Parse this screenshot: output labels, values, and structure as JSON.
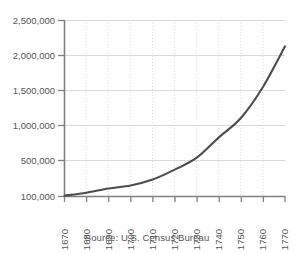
{
  "chart_data": {
    "type": "line",
    "title": "",
    "subtitle": "",
    "xlabel": "",
    "ylabel": "",
    "x": [
      1670,
      1680,
      1690,
      1700,
      1710,
      1720,
      1730,
      1740,
      1750,
      1760,
      1770
    ],
    "values": [
      111000,
      152000,
      210000,
      251000,
      332000,
      466000,
      629000,
      906000,
      1171000,
      1594000,
      2148000
    ],
    "series": [
      {
        "name": "U.S. population",
        "values": [
          111000,
          152000,
          210000,
          251000,
          332000,
          466000,
          629000,
          906000,
          1171000,
          1594000,
          2148000
        ]
      }
    ],
    "x_tick_labels": [
      "1670",
      "1680",
      "1690",
      "1700",
      "1710",
      "1720",
      "1730",
      "1740",
      "1750",
      "1760",
      "1770"
    ],
    "y_tick_labels": [
      "2,500,000",
      "2,000,000",
      "1,500,000",
      "1,000,000",
      "500,000",
      "100,000"
    ],
    "y_tick_values": [
      2500000,
      2000000,
      1500000,
      1000000,
      500000,
      100000
    ],
    "xlim": [
      1670,
      1770
    ],
    "ylim": [
      100000,
      2500000
    ],
    "grid": "horizontal-solid-vertical-dotted",
    "legend": "none",
    "line_color": "#4d4d4d",
    "grid_color": "#d9d9d9",
    "axis_color": "#808080",
    "text_color": "#555555",
    "x_label_rotation": -90
  },
  "caption": {
    "source_text": "Source: U.S. Census Bureau"
  }
}
